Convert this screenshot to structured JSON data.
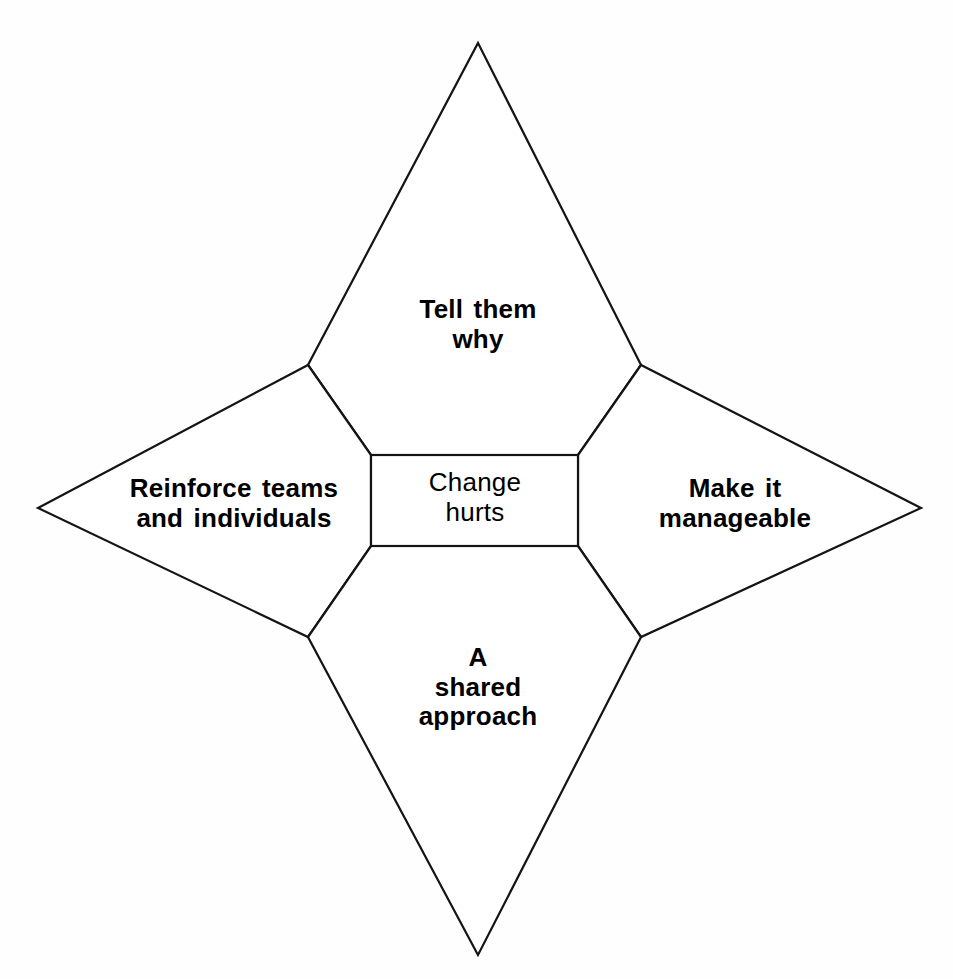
{
  "diagram": {
    "kind": "four-pointed-star-concept-diagram",
    "center": {
      "name": "center-box",
      "text": "Change\nhurts",
      "lines": [
        "Change",
        "hurts"
      ],
      "font_weight": "normal"
    },
    "points": [
      {
        "position": "north",
        "name": "tell-them-why",
        "text": "Tell them\nwhy",
        "lines": [
          "Tell them",
          "why"
        ],
        "font_weight": "bold"
      },
      {
        "position": "west",
        "name": "reinforce-teams-and-individuals",
        "text": "Reinforce teams\nand individuals",
        "lines": [
          "Reinforce teams",
          "and individuals"
        ],
        "font_weight": "bold"
      },
      {
        "position": "east",
        "name": "make-it-manageable",
        "text": "Make it\nmanageable",
        "lines": [
          "Make it",
          "manageable"
        ],
        "font_weight": "bold"
      },
      {
        "position": "south",
        "name": "a-shared-approach",
        "text": "A\nshared\napproach",
        "lines": [
          "A",
          "shared",
          "approach"
        ],
        "font_weight": "bold"
      }
    ],
    "colors": {
      "background": "#fefefe",
      "stroke": "#141414",
      "text": "#000000",
      "fill": "#ffffff"
    },
    "geometry": {
      "apex_north": [
        478,
        43
      ],
      "apex_west": [
        38,
        508
      ],
      "apex_east": [
        921,
        508
      ],
      "apex_south": [
        478,
        955
      ],
      "inner_top_left": [
        308,
        365
      ],
      "inner_top_right": [
        641,
        365
      ],
      "inner_bottom_left": [
        308,
        637
      ],
      "inner_bottom_right": [
        641,
        637
      ],
      "box_left": 371,
      "box_top": 455,
      "box_right": 578,
      "box_bottom": 546,
      "stroke_width": 2.2
    }
  }
}
